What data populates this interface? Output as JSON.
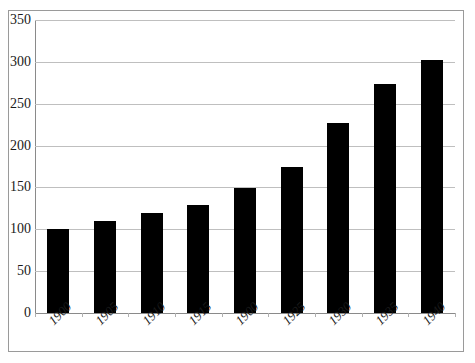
{
  "chart_data": {
    "type": "bar",
    "title": "",
    "xlabel": "",
    "ylabel": "",
    "categories": [
      "1900",
      "1905",
      "1910",
      "1915",
      "1900",
      "1925",
      "1930",
      "1935",
      "1940"
    ],
    "values": [
      100,
      110,
      119,
      129,
      149,
      174,
      227,
      273,
      302
    ],
    "ylim": [
      0,
      350
    ],
    "y_ticks": [
      0,
      50,
      100,
      150,
      200,
      250,
      300,
      350
    ],
    "y_tick_labels": [
      "0",
      "50",
      "100",
      "150",
      "200",
      "250",
      "300",
      "350"
    ],
    "grid": true,
    "legend": "none",
    "bar_color": "#000000",
    "grid_color": "#bfbfbf",
    "axis_color": "#8a8a8a",
    "frame_color": "#9a9a9a",
    "background_color": "#ffffff"
  }
}
